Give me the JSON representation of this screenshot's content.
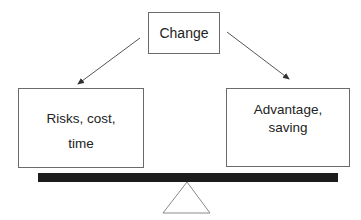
{
  "diagram": {
    "type": "balance-scale",
    "top_node": {
      "label": "Change"
    },
    "left_node": {
      "lines": [
        "Risks, cost,",
        "time"
      ]
    },
    "right_node": {
      "lines": [
        "Advantage,",
        "saving"
      ]
    },
    "edges": [
      {
        "from": "Change",
        "to": "Risks, cost, time"
      },
      {
        "from": "Change",
        "to": "Advantage, saving"
      }
    ],
    "colors": {
      "box_border": "#6a6a6a",
      "arrow": "#555555",
      "beam": "#1c1c1c",
      "fulcrum": "#8a8a8a"
    }
  }
}
